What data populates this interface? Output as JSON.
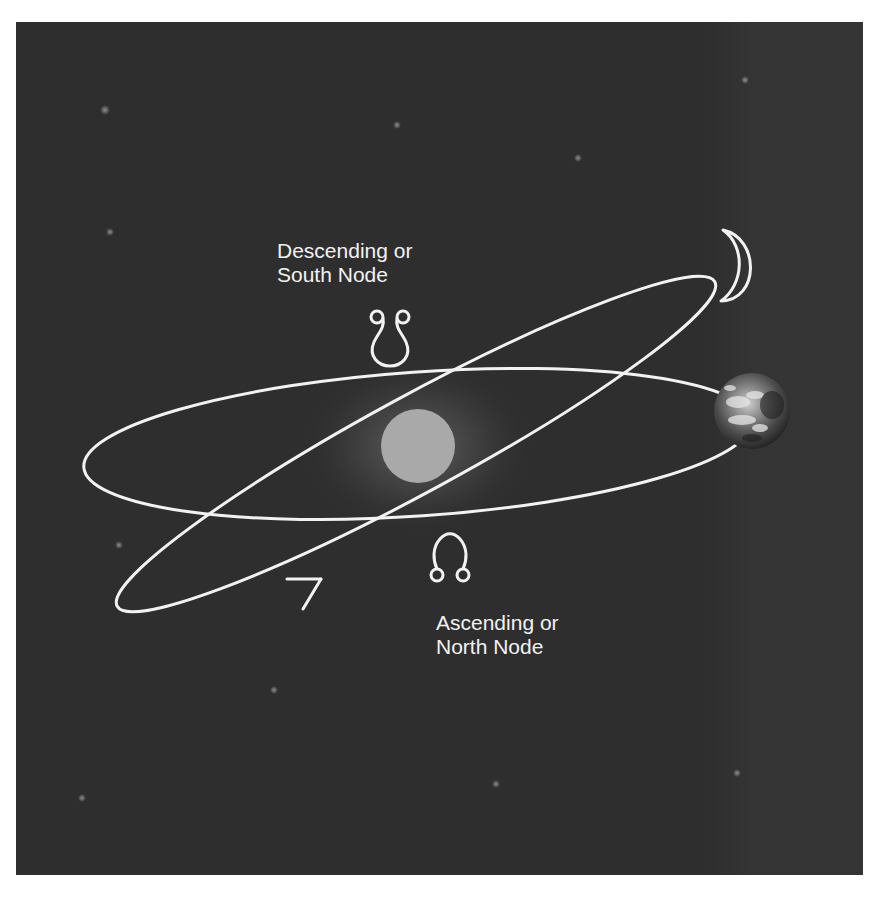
{
  "diagram": {
    "background_color": "#2e2e2e",
    "line_color": "#f2f2f2",
    "labels": {
      "south_node": {
        "line1": "Descending or",
        "line2": "South Node",
        "symbol": "☋"
      },
      "north_node": {
        "line1": "Ascending or",
        "line2": "North Node",
        "symbol": "☊"
      }
    },
    "bodies": {
      "sun": {
        "name": "Sun",
        "color": "#a9a9a9"
      },
      "earth": {
        "name": "Earth"
      },
      "moon": {
        "name": "Moon",
        "shape": "crescent"
      }
    },
    "orbits": [
      {
        "name": "Earth orbit (ecliptic)"
      },
      {
        "name": "Moon orbit (inclined)",
        "direction_arrow": "counterclockwise"
      }
    ],
    "stars": [
      {
        "x": 105,
        "y": 110
      },
      {
        "x": 397,
        "y": 125
      },
      {
        "x": 578,
        "y": 158
      },
      {
        "x": 745,
        "y": 80
      },
      {
        "x": 110,
        "y": 232
      },
      {
        "x": 119,
        "y": 545
      },
      {
        "x": 274,
        "y": 690
      },
      {
        "x": 82,
        "y": 798
      },
      {
        "x": 496,
        "y": 784
      },
      {
        "x": 737,
        "y": 773
      }
    ]
  }
}
